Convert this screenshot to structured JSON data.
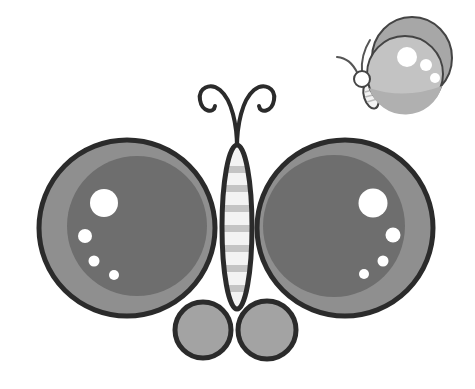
{
  "image": {
    "description": "Cartoon illustration of a grey butterfly with round wings, with a smaller butterfly flying in the top right",
    "width": 475,
    "height": 389
  },
  "colors": {
    "background": "#ffffff",
    "outline": "#2b2b2b",
    "wing_outer": "#8f8f8f",
    "wing_inner": "#6e6e6e",
    "lower_wing": "#a3a3a3",
    "body": "#f3f3f3",
    "body_stripes": "#c4c4c4",
    "highlight": "#ffffff",
    "small_back_wing": "#a7a7a7",
    "small_front_wing": "#c3c3c3",
    "small_front_wing_lower": "#b3b3b3"
  },
  "main_butterfly": {
    "left_wing": {
      "cx": 127,
      "cy": 228,
      "r": 88,
      "inner_cx": 137,
      "inner_cy": 226,
      "inner_r": 70
    },
    "right_wing": {
      "cx": 345,
      "cy": 228,
      "r": 88,
      "inner_cx": 334,
      "inner_cy": 226,
      "inner_r": 71
    },
    "left_lower_wing": {
      "cx": 203,
      "cy": 330,
      "r": 28
    },
    "right_lower_wing": {
      "cx": 267,
      "cy": 330,
      "r": 29
    },
    "body": {
      "cx": 237,
      "cy": 227,
      "rx": 15,
      "ry": 82
    },
    "stripe_count": 7
  },
  "small_butterfly": {
    "back_wing": {
      "cx": 412,
      "cy": 58,
      "rx": 40,
      "ry": 42
    },
    "front_wing": {
      "cx": 405,
      "cy": 74,
      "r": 38
    },
    "head": {
      "cx": 362,
      "cy": 79,
      "r": 8
    }
  }
}
